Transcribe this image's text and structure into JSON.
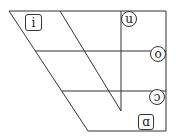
{
  "diagram": {
    "type": "vowel-chart-trapezoid",
    "colors": {
      "line": "#333333",
      "background": "#ffffff"
    },
    "vowels": [
      {
        "symbol": "i",
        "shape": "rounded-box",
        "position": "close front"
      },
      {
        "symbol": "u",
        "shape": "circle",
        "position": "close back"
      },
      {
        "symbol": "o",
        "shape": "circle",
        "position": "close-mid back"
      },
      {
        "symbol": "ɔ",
        "shape": "circle",
        "position": "open-mid back"
      },
      {
        "symbol": "ɑ",
        "shape": "rounded-box",
        "position": "open back"
      }
    ]
  }
}
